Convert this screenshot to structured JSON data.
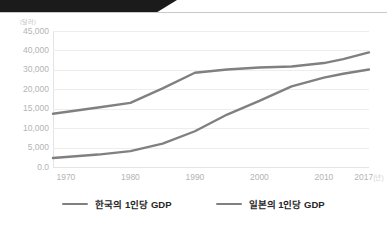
{
  "banner": {
    "name": "top-banner",
    "color": "#1b1b1b"
  },
  "chart_data": {
    "type": "line",
    "title": "",
    "subtitle": "",
    "xlabel": "",
    "ylabel": "",
    "unit_label": "(달러)",
    "x_unit_suffix": "(년)",
    "grid": true,
    "legend_position": "bottom",
    "line_color": "#808080",
    "categories": [
      1970,
      1980,
      1990,
      2000,
      2010,
      2017
    ],
    "xtick_labels": [
      "1970",
      "1980",
      "1990",
      "2000",
      "2010",
      "2017"
    ],
    "ytick_labels": [
      "45,000",
      "40,000",
      "30,000",
      "20,000",
      "15,000",
      "10,000",
      "5,000",
      "0.0"
    ],
    "ytick_values": [
      45000,
      40000,
      30000,
      20000,
      15000,
      10000,
      5000,
      0
    ],
    "xlim": [
      1968,
      2017
    ],
    "ylim": [
      0,
      45000
    ],
    "series": [
      {
        "name": "한국의 1인당 GDP",
        "color": "#808080",
        "x": [
          1968,
          1975,
          1980,
          1985,
          1990,
          1995,
          2000,
          2005,
          2010,
          2013,
          2017
        ],
        "values": [
          2300,
          3200,
          4100,
          6000,
          9200,
          13500,
          17000,
          21500,
          26000,
          28000,
          30200
        ]
      },
      {
        "name": "일본의 1인당 GDP",
        "color": "#808080",
        "x": [
          1968,
          1975,
          1980,
          1985,
          1990,
          1995,
          2000,
          2005,
          2010,
          2013,
          2017
        ],
        "values": [
          13700,
          15300,
          16500,
          20500,
          28500,
          30200,
          31200,
          31700,
          33500,
          35500,
          39000
        ]
      }
    ]
  },
  "legend": {
    "items": [
      {
        "label": "한국의 1인당 GDP"
      },
      {
        "label": "일본의 1인당 GDP"
      }
    ]
  }
}
